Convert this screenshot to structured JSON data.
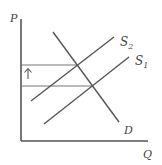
{
  "diagram": {
    "type": "supply-demand",
    "axes": {
      "y_label": "P",
      "x_label": "Q"
    },
    "curves": [
      {
        "name": "S2",
        "label": "S",
        "sub": "2"
      },
      {
        "name": "S1",
        "label": "S",
        "sub": "1"
      },
      {
        "name": "D",
        "label": "D"
      }
    ],
    "annotation": {
      "arrow": "up",
      "meaning": "price increase"
    },
    "colors": {
      "line": "#555555",
      "guide": "#777777"
    }
  }
}
